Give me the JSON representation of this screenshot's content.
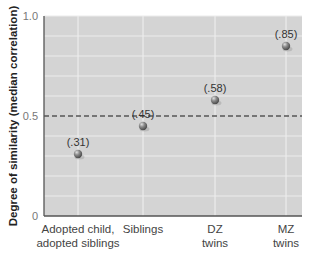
{
  "chart_data": {
    "type": "scatter",
    "title": "",
    "xlabel": "",
    "ylabel": "Degree of similarity (median correlation)",
    "categories": [
      "Adopted child, adopted siblings",
      "Siblings",
      "DZ twins",
      "MZ twins"
    ],
    "category_lines": [
      [
        "Adopted child,",
        "adopted siblings"
      ],
      [
        "Siblings"
      ],
      [
        "DZ",
        "twins"
      ],
      [
        "MZ",
        "twins"
      ]
    ],
    "values": [
      0.31,
      0.45,
      0.58,
      0.85
    ],
    "data_labels": [
      "(.31)",
      "(.45)",
      "(.58)",
      "(.85)"
    ],
    "yticks": [
      0,
      0.5,
      1.0
    ],
    "ytick_labels": [
      "0",
      "0.5",
      "1.0"
    ],
    "ylim": [
      0,
      1.0
    ],
    "grid": true,
    "reference_line": {
      "y": 0.5,
      "style": "dashed"
    },
    "legend": null
  },
  "colors": {
    "plot_background": "#d4d4d4",
    "grid": "#ececec",
    "axis": "#555555",
    "point": "#7a7a7a",
    "reference_line": "#555555"
  }
}
